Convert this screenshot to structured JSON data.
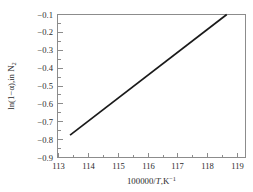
{
  "chart_data": {
    "type": "line",
    "title": "",
    "subtitle": "",
    "xlabel": "100000/T,K⁻¹",
    "xlabel_parts": {
      "prefix": "100000/",
      "italic": "T",
      "suffix": ",K"
    },
    "xlabel_sup": "−1",
    "ylabel": "ln(1−α),in N₂",
    "ylabel_parts": {
      "main": "ln(1−α),in N",
      "sub": "2"
    },
    "xlim": [
      112.55,
      119.55
    ],
    "ylim": [
      -0.9,
      -0.1
    ],
    "xticks": [
      113,
      114,
      115,
      116,
      117,
      118,
      119
    ],
    "xtick_labels": [
      "113",
      "114",
      "115",
      "116",
      "117",
      "118",
      "119"
    ],
    "yticks": [
      -0.9,
      -0.8,
      -0.7,
      -0.6,
      -0.5,
      -0.4,
      -0.3,
      -0.2,
      -0.1
    ],
    "ytick_labels": [
      "−0.9",
      "−0.8",
      "−0.7",
      "−0.6",
      "−0.5",
      "−0.4",
      "−0.3",
      "−0.2",
      "−0.1"
    ],
    "minor_ticks_per_interval": 1,
    "grid": false,
    "legend": null,
    "series": [
      {
        "name": "ln(1−α) vs 100000/T",
        "style": "solid",
        "color": "#1a1a1a",
        "x": [
          113.0,
          118.85
        ],
        "y": [
          -0.775,
          -0.1
        ]
      }
    ],
    "annotations": [],
    "colors": {
      "line": "#1a1a1a",
      "axis": "#8c8c8c",
      "text": "#2b2b2b",
      "background": "#ffffff"
    }
  }
}
